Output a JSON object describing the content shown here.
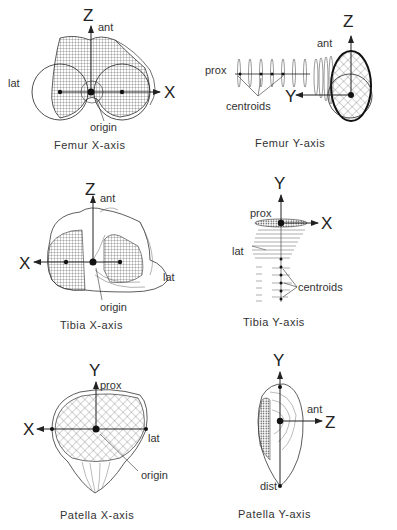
{
  "panels": [
    {
      "id": "femur-x",
      "caption": "Femur   X-axis",
      "bone": "Femur",
      "axis_view": "X-axis",
      "axes": {
        "vertical": "Z",
        "horizontal": "X"
      },
      "labels": {
        "top": "ant",
        "side": "lat",
        "pointer": "origin"
      }
    },
    {
      "id": "femur-y",
      "caption": "Femur   Y-axis",
      "bone": "Femur",
      "axis_view": "Y-axis",
      "axes": {
        "vertical": "Z",
        "horizontal": "Y"
      },
      "labels": {
        "top": "ant",
        "side": "prox",
        "pointer": "centroids"
      }
    },
    {
      "id": "tibia-x",
      "caption": "Tibia   X-axis",
      "bone": "Tibia",
      "axis_view": "X-axis",
      "axes": {
        "vertical": "Z",
        "horizontal": "X"
      },
      "labels": {
        "top": "ant",
        "side": "lat",
        "pointer": "origin"
      }
    },
    {
      "id": "tibia-y",
      "caption": "Tibia   Y-axis",
      "bone": "Tibia",
      "axis_view": "Y-axis",
      "axes": {
        "vertical": "Y",
        "horizontal": "X"
      },
      "labels": {
        "top": "prox",
        "side": "lat",
        "pointer": "centroids"
      }
    },
    {
      "id": "patella-x",
      "caption": "Patella   X-axis",
      "bone": "Patella",
      "axis_view": "X-axis",
      "axes": {
        "vertical": "Y",
        "horizontal": "X"
      },
      "labels": {
        "top": "prox",
        "side": "lat",
        "pointer": "origin"
      }
    },
    {
      "id": "patella-y",
      "caption": "Patella   Y-axis",
      "bone": "Patella",
      "axis_view": "Y-axis",
      "axes": {
        "vertical": "Y",
        "horizontal": "Z"
      },
      "labels": {
        "top": "ant",
        "bottom": "dist"
      }
    }
  ],
  "colors": {
    "line": "#222222",
    "mesh": "#555555",
    "background": "#ffffff"
  }
}
